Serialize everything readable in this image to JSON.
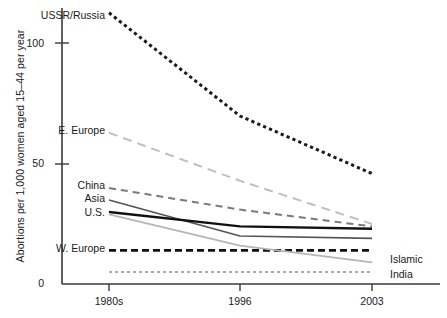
{
  "chart_data": {
    "type": "line",
    "title": "",
    "subtitle": "",
    "xlabel": "",
    "ylabel": "Abortions per 1,000 women aged 15–44 per year",
    "categories": [
      "1980s",
      "1996",
      "2003"
    ],
    "x_tick_labels": [
      "1980s",
      "1996",
      "2003"
    ],
    "y_tick_labels": [
      "0",
      "50",
      "100"
    ],
    "y_ticks": [
      0,
      50,
      100
    ],
    "ylim": [
      0,
      118
    ],
    "grid": false,
    "legend_position": "inline-endpoint-labels",
    "series": [
      {
        "name": "USSR/Russia",
        "values": [
          113,
          70,
          46
        ],
        "color": "#1a1a1a",
        "style": "dotted-heavy",
        "label_side": "left",
        "label_x": 38,
        "label_y": 9
      },
      {
        "name": "E. Europe",
        "values": [
          63,
          43,
          25
        ],
        "color": "#c0c0c0",
        "style": "dashed-long",
        "label_side": "left",
        "label_x": 38,
        "label_y": 124
      },
      {
        "name": "China",
        "values": [
          40,
          31,
          24
        ],
        "color": "#7a7a7a",
        "style": "dashed-medium",
        "label_side": "left",
        "label_x": 55,
        "label_y": 179
      },
      {
        "name": "Asia",
        "values": [
          35,
          20,
          19
        ],
        "color": "#555555",
        "style": "solid",
        "label_side": "left",
        "label_x": 62,
        "label_y": 192
      },
      {
        "name": "U.S.",
        "values": [
          30,
          24,
          23
        ],
        "color": "#111111",
        "style": "solid-thick",
        "label_side": "left",
        "label_x": 62,
        "label_y": 206
      },
      {
        "name": "W. Europe",
        "values": [
          14,
          14,
          14
        ],
        "color": "#111111",
        "style": "dashed-thick",
        "label_side": "left",
        "label_x": 22,
        "label_y": 242
      },
      {
        "name": "Islamic",
        "values": [
          29,
          16,
          9
        ],
        "color": "#b5b5b5",
        "style": "solid",
        "label_side": "right",
        "label_x": 390,
        "label_y": 253
      },
      {
        "name": "India",
        "values": [
          5,
          5,
          5
        ],
        "color": "#909090",
        "style": "dotted-fine",
        "label_side": "right",
        "label_x": 390,
        "label_y": 268
      }
    ]
  },
  "axes": {
    "y_tick_0": "0",
    "y_tick_50": "50",
    "y_tick_100": "100",
    "x_tick_1": "1980s",
    "x_tick_2": "1996",
    "x_tick_3": "2003"
  },
  "colors": {
    "axis": "#3a3a3a",
    "text": "#1a1a1a",
    "background": "#ffffff"
  }
}
